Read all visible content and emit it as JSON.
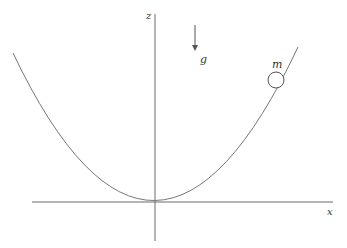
{
  "diagram": {
    "labels": {
      "z_axis": "z",
      "x_axis": "x",
      "gravity": "g",
      "mass": "m"
    },
    "colors": {
      "line": "#6b6b6b",
      "text": "#333333",
      "background": "#ffffff"
    },
    "elements": [
      {
        "type": "axis",
        "name": "z-axis",
        "orientation": "vertical"
      },
      {
        "type": "axis",
        "name": "x-axis",
        "orientation": "horizontal"
      },
      {
        "type": "curve",
        "name": "parabola",
        "shape": "z = k x^2",
        "vertex": "origin"
      },
      {
        "type": "arrow",
        "name": "gravity-arrow",
        "direction": "down",
        "label": "g"
      },
      {
        "type": "circle",
        "name": "bead",
        "label": "m",
        "position": "on right branch of parabola"
      }
    ]
  }
}
